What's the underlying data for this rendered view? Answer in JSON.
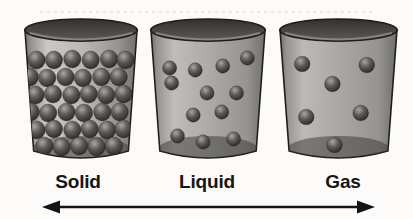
{
  "background": "#fcfbf9",
  "palette": {
    "outline": "#1f1d1b",
    "rim_top": "#33312f",
    "rim_bottom": "#5c5a58",
    "rim_highlight": "#a6a4a2",
    "body_edge_dark": "#716f6d",
    "body_edge_mid": "#969492",
    "bottom_shadow": "#37352f",
    "sphere_hi": "#a9a7a5",
    "sphere_mid": "#5d5b59",
    "sphere_dark": "#262422",
    "label_color": "#161616"
  },
  "cups": [
    {
      "id": "solid",
      "label": "Solid",
      "left": 23,
      "width": 116,
      "label_x": 78,
      "body_tint_light": "#cbc9c7",
      "body_tint": "#bab8b6",
      "particle_r": 9,
      "particles": [
        [
          14,
          47
        ],
        [
          32,
          47
        ],
        [
          51,
          46
        ],
        [
          70,
          47
        ],
        [
          89,
          46
        ],
        [
          106,
          47
        ],
        [
          7,
          64
        ],
        [
          25,
          65
        ],
        [
          44,
          64
        ],
        [
          62,
          65
        ],
        [
          81,
          64
        ],
        [
          99,
          64
        ],
        [
          13,
          82
        ],
        [
          31,
          81
        ],
        [
          50,
          82
        ],
        [
          68,
          81
        ],
        [
          86,
          82
        ],
        [
          104,
          81
        ],
        [
          8,
          99
        ],
        [
          26,
          100
        ],
        [
          45,
          99
        ],
        [
          63,
          100
        ],
        [
          82,
          99
        ],
        [
          100,
          99
        ],
        [
          14,
          117
        ],
        [
          32,
          116
        ],
        [
          51,
          117
        ],
        [
          69,
          116
        ],
        [
          87,
          117
        ],
        [
          104,
          116
        ],
        [
          22,
          133
        ],
        [
          40,
          134
        ],
        [
          58,
          133
        ],
        [
          76,
          134
        ],
        [
          94,
          133
        ]
      ]
    },
    {
      "id": "liquid",
      "label": "Liquid",
      "left": 149,
      "width": 118,
      "label_x": 207,
      "body_tint_light": "#bfbdbb",
      "body_tint": "#abaaa8",
      "particle_r": 7.2,
      "particles": [
        [
          21,
          55
        ],
        [
          47,
          57
        ],
        [
          75,
          53
        ],
        [
          100,
          45
        ],
        [
          23,
          70
        ],
        [
          59,
          80
        ],
        [
          89,
          80
        ],
        [
          45,
          102
        ],
        [
          74,
          99
        ],
        [
          29,
          123
        ],
        [
          55,
          129
        ],
        [
          86,
          126
        ]
      ]
    },
    {
      "id": "gas",
      "label": "Gas",
      "left": 278,
      "width": 121,
      "label_x": 343,
      "body_tint_light": "#bcbab8",
      "body_tint": "#a9a7a5",
      "particle_r": 7.8,
      "particles": [
        [
          24,
          51
        ],
        [
          88,
          52
        ],
        [
          54,
          71
        ],
        [
          28,
          104
        ],
        [
          82,
          100
        ],
        [
          56,
          132
        ]
      ]
    }
  ],
  "axis_arrow": {
    "x1": 42,
    "x2": 375,
    "y": 207,
    "color": "#141414"
  }
}
